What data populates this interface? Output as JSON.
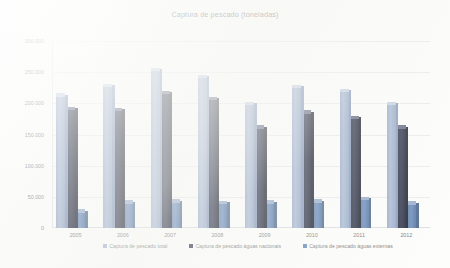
{
  "chart_data": {
    "type": "bar",
    "title": "Captura de pescado (toneladas)",
    "xlabel": "",
    "ylabel": "",
    "categories": [
      "2005",
      "2006",
      "2007",
      "2008",
      "2009",
      "2010",
      "2011",
      "2012"
    ],
    "ylim": [
      0,
      300000
    ],
    "yticks": [
      0,
      50000,
      100000,
      150000,
      200000,
      250000,
      300000
    ],
    "ytick_labels": [
      "0",
      "50.000",
      "100.000",
      "150.000",
      "200.000",
      "250.000",
      "300.000"
    ],
    "grid": true,
    "legend_position": "bottom",
    "series": [
      {
        "name": "Captura de pescado total",
        "color": "#9aadcd",
        "values": [
          211000,
          227000,
          252000,
          241000,
          198000,
          225000,
          219000,
          198000
        ]
      },
      {
        "name": "Captura de pescado águas nacionais",
        "color": "#20263c",
        "values": [
          190000,
          188000,
          215000,
          206000,
          160000,
          184000,
          175000,
          160000
        ]
      },
      {
        "name": "Captura de pescado águas externas",
        "color": "#5b80b4",
        "values": [
          25000,
          40000,
          41000,
          39000,
          40000,
          41000,
          45000,
          38000
        ]
      }
    ]
  },
  "legend": {
    "items": [
      {
        "label": "Captura de pescado total",
        "marker": "square-marker"
      },
      {
        "label": "Captura de pescado águas nacionais",
        "marker": "square-marker"
      },
      {
        "label": "Captura de pescado águas externas",
        "marker": "square-marker"
      }
    ]
  }
}
